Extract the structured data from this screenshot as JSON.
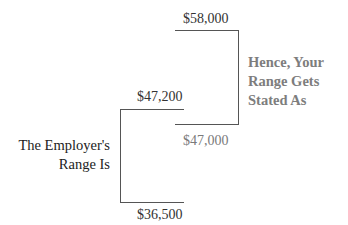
{
  "diagram": {
    "type": "range-brackets",
    "employer_range": {
      "caption_line1": "The Employer's",
      "caption_line2": "Range Is",
      "high": "$47,200",
      "low": "$36,500"
    },
    "stated_range": {
      "caption_line1": "Hence, Your",
      "caption_line2": "Range Gets",
      "caption_line3": "Stated As",
      "high": "$58,000",
      "low": "$47,000"
    },
    "colors": {
      "line": "#555555",
      "dark_text": "#222222",
      "gray_text": "#7d7d7d"
    }
  }
}
